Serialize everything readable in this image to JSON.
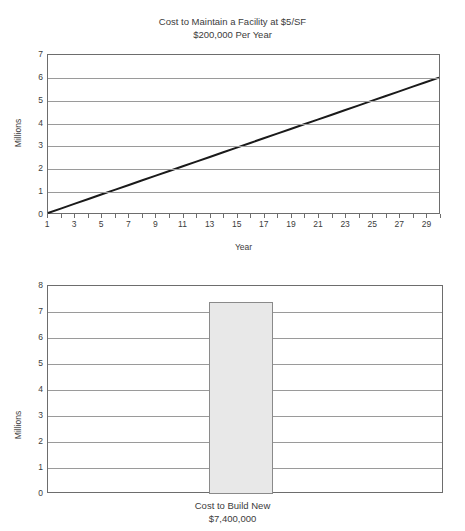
{
  "top_partial_text": "· · ·",
  "chart_data": [
    {
      "type": "line",
      "title": "Cost to Maintain a Facility at $5/SF\n$200,000 Per Year",
      "title_line1": "Cost to Maintain a Facility at $5/SF",
      "title_line2": "$200,000 Per Year",
      "xlabel": "Year",
      "ylabel": "Millions",
      "xlim": [
        1,
        30
      ],
      "ylim": [
        0,
        7
      ],
      "ytick_labels": [
        "7",
        "6",
        "5",
        "4",
        "3",
        "2",
        "1",
        "0"
      ],
      "ytick_values": [
        7,
        6,
        5,
        4,
        3,
        2,
        1,
        0
      ],
      "xtick_labels": [
        "1",
        "3",
        "5",
        "7",
        "9",
        "11",
        "13",
        "15",
        "17",
        "19",
        "21",
        "23",
        "25",
        "27",
        "29"
      ],
      "xtick_values": [
        1,
        3,
        5,
        7,
        9,
        11,
        13,
        15,
        17,
        19,
        21,
        23,
        25,
        27,
        29
      ],
      "grid": true,
      "legend": "none",
      "series": [
        {
          "name": "Cumulative maintenance cost",
          "x": [
            1,
            2,
            3,
            4,
            5,
            6,
            7,
            8,
            9,
            10,
            11,
            12,
            13,
            14,
            15,
            16,
            17,
            18,
            19,
            20,
            21,
            22,
            23,
            24,
            25,
            26,
            27,
            28,
            29,
            30
          ],
          "values": [
            0.0,
            0.2068,
            0.4138,
            0.6207,
            0.8276,
            1.0345,
            1.2414,
            1.4483,
            1.6552,
            1.8621,
            2.069,
            2.2759,
            2.4828,
            2.6897,
            2.8966,
            3.1034,
            3.3103,
            3.5172,
            3.7241,
            3.931,
            4.1379,
            4.3448,
            4.5517,
            4.7586,
            4.9655,
            5.1724,
            5.3793,
            5.5862,
            5.7931,
            6.0
          ],
          "color": "#1a1a1a"
        }
      ]
    },
    {
      "type": "bar",
      "title": "",
      "caption_line1": "Cost to Build New",
      "caption_line2": "$7,400,000",
      "xlabel": "",
      "ylabel": "Millions",
      "ylim": [
        0,
        8
      ],
      "ytick_labels": [
        "8",
        "7",
        "6",
        "5",
        "4",
        "3",
        "2",
        "1",
        "0"
      ],
      "ytick_values": [
        8,
        7,
        6,
        5,
        4,
        3,
        2,
        1,
        0
      ],
      "categories": [
        "Cost to Build New"
      ],
      "values": [
        7.4
      ],
      "grid": true,
      "legend": "none",
      "bar_fill": "#e8e8e8",
      "bar_stroke": "#8a8a8a"
    }
  ]
}
